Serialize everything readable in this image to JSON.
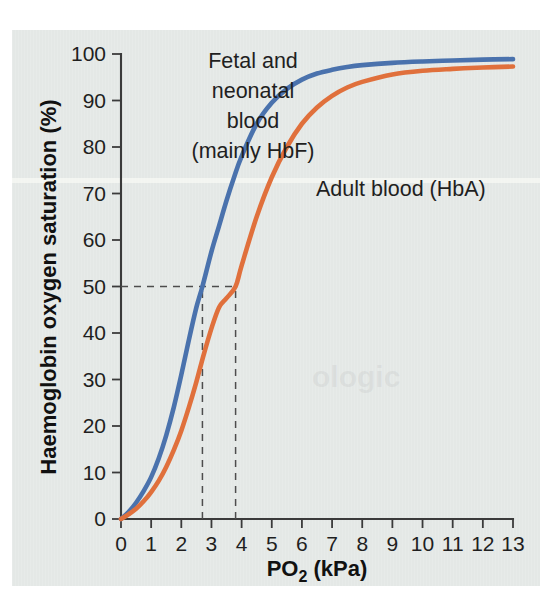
{
  "figure": {
    "background_color": "#e4e8e6",
    "page_color": "#ffffff",
    "ghost_text": "ologic"
  },
  "chart_data": {
    "type": "line",
    "title": "",
    "xlabel": "PO2 (kPa)",
    "xlabel_base": "PO",
    "xlabel_sub": "2",
    "xlabel_unit": " (kPa)",
    "ylabel": "Haemoglobin oxygen saturation (%)",
    "xlim": [
      0,
      13
    ],
    "ylim": [
      0,
      100
    ],
    "grid": false,
    "legend_position": "inline-annotations",
    "xticks": [
      0,
      1,
      2,
      3,
      4,
      5,
      6,
      7,
      8,
      9,
      10,
      11,
      12,
      13
    ],
    "xtick_labels": [
      "0",
      "1",
      "2",
      "3",
      "4",
      "5",
      "6",
      "7",
      "8",
      "9",
      "10",
      "11",
      "12",
      "13"
    ],
    "yticks": [
      0,
      10,
      20,
      30,
      40,
      50,
      60,
      70,
      80,
      90,
      100
    ],
    "ytick_labels": [
      "0",
      "10",
      "20",
      "30",
      "40",
      "50",
      "60",
      "70",
      "80",
      "90",
      "100"
    ],
    "series": [
      {
        "name": "Fetal and neonatal blood (mainly HbF)",
        "color": "#4a72ad",
        "p50": 2.7,
        "x": [
          0,
          0.25,
          0.5,
          0.75,
          1.0,
          1.25,
          1.5,
          1.75,
          2.0,
          2.25,
          2.5,
          2.7,
          3.0,
          3.25,
          3.5,
          3.75,
          4.0,
          4.5,
          5.0,
          5.5,
          6.0,
          6.5,
          7.0,
          7.5,
          8.0,
          9.0,
          10.0,
          11.0,
          12.0,
          13.0
        ],
        "values": [
          0,
          1.5,
          3.5,
          6.0,
          9.0,
          13.0,
          18.0,
          24.0,
          31.0,
          38.5,
          45.5,
          50.0,
          57.5,
          63.0,
          68.5,
          73.5,
          78.0,
          85.0,
          89.5,
          92.5,
          94.5,
          95.8,
          96.6,
          97.2,
          97.6,
          98.1,
          98.4,
          98.6,
          98.8,
          98.9
        ]
      },
      {
        "name": "Adult blood (HbA)",
        "color": "#e0703c",
        "p50": 3.8,
        "x": [
          0,
          0.25,
          0.5,
          0.75,
          1.0,
          1.25,
          1.5,
          1.75,
          2.0,
          2.25,
          2.5,
          2.75,
          3.0,
          3.25,
          3.5,
          3.8,
          4.0,
          4.5,
          5.0,
          5.5,
          6.0,
          6.5,
          7.0,
          7.5,
          8.0,
          9.0,
          10.0,
          11.0,
          12.0,
          13.0
        ],
        "values": [
          0,
          1.0,
          2.2,
          3.8,
          5.8,
          8.2,
          11.2,
          14.8,
          19.0,
          24.0,
          29.5,
          35.5,
          41.0,
          45.5,
          47.5,
          50.0,
          54.5,
          65.0,
          73.5,
          80.0,
          85.0,
          88.5,
          91.0,
          92.8,
          94.0,
          95.6,
          96.4,
          96.8,
          97.1,
          97.3
        ]
      }
    ],
    "guides": [
      {
        "name": "p50-horizontal",
        "type": "horizontal",
        "y": 50,
        "x_from": 0,
        "x_to": 3.8
      },
      {
        "name": "p50-fetal-vertical",
        "type": "vertical",
        "x": 2.7,
        "y_from": 0,
        "y_to": 50
      },
      {
        "name": "p50-adult-vertical",
        "type": "vertical",
        "x": 3.8,
        "y_from": 0,
        "y_to": 50
      }
    ],
    "annotations": [
      {
        "name": "fetal-blood-label",
        "lines": [
          "Fetal and",
          "neonatal",
          "blood",
          "(mainly HbF)"
        ],
        "x_px": 253,
        "y_px": 68,
        "align": "middle",
        "color": "#1f1f1f"
      },
      {
        "name": "adult-blood-label",
        "lines": [
          "Adult blood (HbA)"
        ],
        "x_px": 316,
        "y_px": 196,
        "align": "start",
        "color": "#1f1f1f"
      }
    ]
  }
}
